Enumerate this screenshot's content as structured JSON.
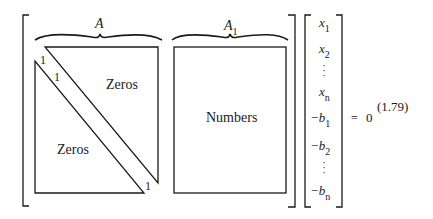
{
  "equation": {
    "matrix": {
      "block_a": {
        "brace_label": "A",
        "upper_region_label": "Zeros",
        "lower_region_label": "Zeros",
        "diagonal_labels": [
          "1",
          "1",
          "1"
        ]
      },
      "block_a1": {
        "brace_label": "A",
        "brace_label_subscript": "1",
        "region_label": "Numbers"
      }
    },
    "vector": {
      "entries": [
        {
          "sign": "",
          "var": "x",
          "sub": "1"
        },
        {
          "sign": "",
          "var": "x",
          "sub": "2"
        },
        {
          "ellipsis": "vertical"
        },
        {
          "sign": "",
          "var": "x",
          "sub": "n"
        },
        {
          "sign": "−",
          "var": "b",
          "sub": "1"
        },
        {
          "sign": "−",
          "var": "b",
          "sub": "2"
        },
        {
          "ellipsis": "vertical"
        },
        {
          "sign": "−",
          "var": "b",
          "sub": "n"
        }
      ],
      "x1": "x",
      "x1_sub": "1",
      "x2": "x",
      "x2_sub": "2",
      "xn": "x",
      "xn_sub": "n",
      "b1": "−b",
      "b1_sub": "1",
      "b2": "−b",
      "b2_sub": "2",
      "bn": "−b",
      "bn_sub": "n"
    },
    "equals": "=",
    "rhs": "0",
    "equation_number": "(1.79)"
  }
}
